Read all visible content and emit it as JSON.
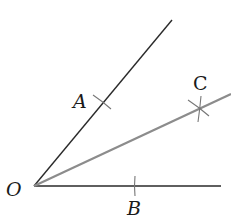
{
  "diagram": {
    "type": "angle bisector construction",
    "colors": {
      "background": "#ffffff",
      "ray": "#2a2a2a",
      "bisector": "#8c8c8c",
      "mark": "#777777",
      "label": "#1a1a1a"
    },
    "vertex": {
      "label": "O",
      "x": 34,
      "y": 186
    },
    "rays": [
      {
        "name": "ray-OA",
        "from": [
          34,
          186
        ],
        "to": [
          172,
          20
        ],
        "color": "#2a2a2a"
      },
      {
        "name": "ray-OB",
        "from": [
          34,
          186
        ],
        "to": [
          221,
          186
        ],
        "color": "#2a2a2a"
      },
      {
        "name": "bisector-OC",
        "from": [
          34,
          186
        ],
        "to": [
          231,
          94
        ],
        "color": "#8c8c8c"
      }
    ],
    "points": {
      "A": {
        "label": "A",
        "x": 102,
        "y": 102
      },
      "B": {
        "label": "B",
        "x": 135,
        "y": 186
      },
      "C": {
        "label": "C",
        "x": 200,
        "y": 109
      }
    }
  }
}
